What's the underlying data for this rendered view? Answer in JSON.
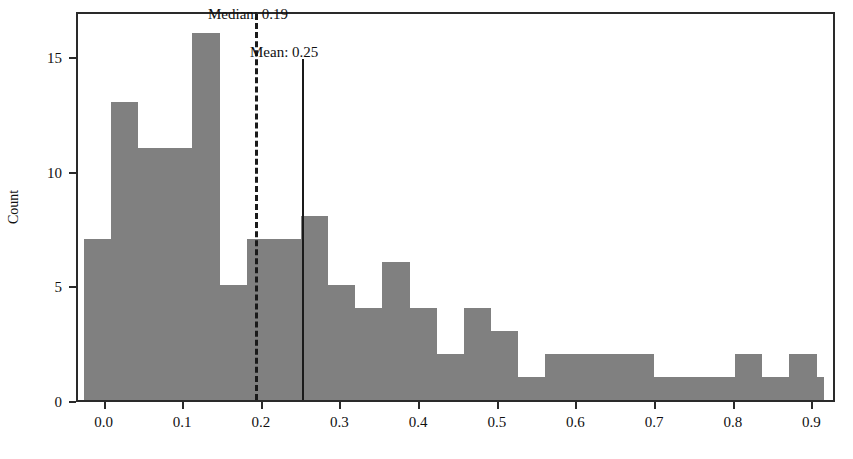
{
  "chart_data": {
    "type": "bar",
    "subtype": "histogram",
    "title": "",
    "xlabel": "",
    "ylabel": "Count",
    "xlim": [
      -0.035,
      0.93
    ],
    "ylim": [
      0,
      17
    ],
    "grid": false,
    "legend": null,
    "bar_color": "#808080",
    "axis_color": "#2a2a2a",
    "bin_width": 0.0345,
    "bin_starts": [
      -0.0275,
      0.007,
      0.0415,
      0.076,
      0.1105,
      0.145,
      0.1795,
      0.214,
      0.2485,
      0.283,
      0.3175,
      0.352,
      0.3865,
      0.421,
      0.4555,
      0.49,
      0.5245,
      0.559,
      0.5935,
      0.628,
      0.6625,
      0.697,
      0.7315,
      0.766,
      0.8005,
      0.835,
      0.8695
    ],
    "values": [
      7,
      13,
      11,
      11,
      16,
      5,
      7,
      7,
      8,
      5,
      4,
      6,
      4,
      2,
      4,
      3,
      1,
      2,
      2,
      2,
      2,
      1,
      1,
      1,
      2,
      1,
      2,
      1,
      1
    ],
    "bars": [
      {
        "x0": -0.0275,
        "x1": 0.007,
        "height": 7
      },
      {
        "x0": 0.007,
        "x1": 0.0415,
        "height": 13
      },
      {
        "x0": 0.0415,
        "x1": 0.076,
        "height": 11
      },
      {
        "x0": 0.076,
        "x1": 0.1105,
        "height": 11
      },
      {
        "x0": 0.1105,
        "x1": 0.145,
        "height": 16
      },
      {
        "x0": 0.145,
        "x1": 0.1795,
        "height": 5
      },
      {
        "x0": 0.1795,
        "x1": 0.214,
        "height": 7
      },
      {
        "x0": 0.214,
        "x1": 0.2485,
        "height": 7
      },
      {
        "x0": 0.2485,
        "x1": 0.283,
        "height": 8
      },
      {
        "x0": 0.283,
        "x1": 0.3175,
        "height": 5
      },
      {
        "x0": 0.3175,
        "x1": 0.352,
        "height": 4
      },
      {
        "x0": 0.352,
        "x1": 0.3865,
        "height": 6
      },
      {
        "x0": 0.3865,
        "x1": 0.421,
        "height": 4
      },
      {
        "x0": 0.421,
        "x1": 0.4555,
        "height": 2
      },
      {
        "x0": 0.4555,
        "x1": 0.49,
        "height": 4
      },
      {
        "x0": 0.49,
        "x1": 0.5245,
        "height": 3
      },
      {
        "x0": 0.5245,
        "x1": 0.559,
        "height": 1
      },
      {
        "x0": 0.559,
        "x1": 0.5935,
        "height": 2
      },
      {
        "x0": 0.5935,
        "x1": 0.628,
        "height": 2
      },
      {
        "x0": 0.628,
        "x1": 0.6625,
        "height": 2
      },
      {
        "x0": 0.6625,
        "x1": 0.697,
        "height": 2
      },
      {
        "x0": 0.697,
        "x1": 0.7315,
        "height": 1
      },
      {
        "x0": 0.7315,
        "x1": 0.766,
        "height": 1
      },
      {
        "x0": 0.766,
        "x1": 0.8005,
        "height": 1
      },
      {
        "x0": 0.8005,
        "x1": 0.835,
        "height": 2
      },
      {
        "x0": 0.835,
        "x1": 0.8695,
        "height": 1
      },
      {
        "x0": 0.8695,
        "x1": 0.904,
        "height": 2
      },
      {
        "x0": 0.904,
        "x1": 0.9135,
        "height": 1
      }
    ],
    "xticks": [
      0.0,
      0.1,
      0.2,
      0.3,
      0.4,
      0.5,
      0.6,
      0.7,
      0.8,
      0.9
    ],
    "xtick_labels": [
      "0.0",
      "0.1",
      "0.2",
      "0.3",
      "0.4",
      "0.5",
      "0.6",
      "0.7",
      "0.8",
      "0.9"
    ],
    "yticks": [
      0,
      5,
      10,
      15
    ],
    "ytick_labels": [
      "0",
      "5",
      "10",
      "15"
    ],
    "annotations": [
      {
        "name": "median",
        "label": "Median: 0.19",
        "value": 0.19,
        "line_style": "dashed"
      },
      {
        "name": "mean",
        "label": "Mean: 0.25",
        "value": 0.25,
        "line_style": "solid"
      }
    ]
  }
}
